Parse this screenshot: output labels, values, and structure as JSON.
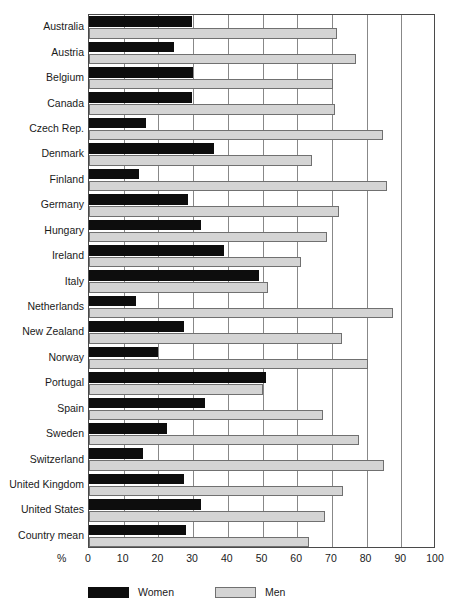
{
  "chart_data": {
    "type": "bar",
    "orientation": "horizontal",
    "title": "",
    "xlabel": "%",
    "ylabel": "",
    "xlim": [
      0,
      100
    ],
    "xticks": [
      0,
      10,
      20,
      30,
      40,
      50,
      60,
      70,
      80,
      90,
      100
    ],
    "xtick_labels": [
      "0",
      "10",
      "20",
      "30",
      "40",
      "50",
      "60",
      "70",
      "80",
      "90",
      "100"
    ],
    "grid": true,
    "grid_axis": "x",
    "legend_position": "bottom-left",
    "categories": [
      "Australia",
      "Austria",
      "Belgium",
      "Canada",
      "Czech Rep.",
      "Denmark",
      "Finland",
      "Germany",
      "Hungary",
      "Ireland",
      "Italy",
      "Netherlands",
      "New Zealand",
      "Norway",
      "Portugal",
      "Spain",
      "Sweden",
      "Switzerland",
      "United Kingdom",
      "United States",
      "Country mean"
    ],
    "series": [
      {
        "name": "Women",
        "color": "#0d0d0d",
        "values": [
          29.7,
          24.5,
          30.0,
          29.7,
          16.4,
          36.0,
          14.4,
          28.6,
          32.3,
          39.0,
          49.0,
          13.5,
          27.4,
          20.0,
          51.0,
          33.3,
          22.4,
          15.5,
          27.4,
          32.3,
          28.0
        ]
      },
      {
        "name": "Men",
        "color": "#d4d4d4",
        "values": [
          71.5,
          77.0,
          70.3,
          71.0,
          84.7,
          64.3,
          86.0,
          72.0,
          68.5,
          61.0,
          51.5,
          87.5,
          73.0,
          80.3,
          50.0,
          67.3,
          77.8,
          85.0,
          73.3,
          68.0,
          63.3
        ]
      }
    ]
  },
  "legend": {
    "items": [
      {
        "label": "Women",
        "swatch": "women"
      },
      {
        "label": "Men",
        "swatch": "men"
      }
    ]
  },
  "axis": {
    "unit_label": "%"
  }
}
